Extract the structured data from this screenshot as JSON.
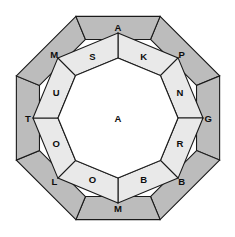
{
  "diagram": {
    "type": "concentric-octagon-ring-puzzle",
    "geometry": {
      "center_x": 118,
      "center_y": 118,
      "outer_radius": 110,
      "middle_radius": 85,
      "inner_radius": 60,
      "sides": 8,
      "outer_ring_rotation_deg": 22.5,
      "inner_ring_rotation_deg": 0
    },
    "colors": {
      "background": "#ffffff",
      "outer_ring_fill": "#bcbcbc",
      "inner_ring_fill": "#e9e9e9",
      "center_fill": "#ffffff",
      "stroke": "#1a1a1a",
      "label_color": "#0d0d0d"
    },
    "outer_ring": {
      "name": "outer-ring",
      "cell_count": 8,
      "cells": [
        {
          "label": "P",
          "index": 0,
          "position": "top-left"
        },
        {
          "label": "G",
          "index": 1,
          "position": "top-right"
        },
        {
          "label": "B",
          "index": 2,
          "position": "right-upper"
        },
        {
          "label": "M",
          "index": 3,
          "position": "right-lower"
        },
        {
          "label": "L",
          "index": 4,
          "position": "bottom-right"
        },
        {
          "label": "T",
          "index": 5,
          "position": "bottom-left"
        },
        {
          "label": "M",
          "index": 6,
          "position": "left-lower"
        },
        {
          "label": "A",
          "index": 7,
          "position": "left-upper"
        }
      ]
    },
    "inner_ring": {
      "name": "inner-ring",
      "cell_count": 8,
      "cells": [
        {
          "label": "K",
          "index": 0,
          "position": "top-left"
        },
        {
          "label": "N",
          "index": 1,
          "position": "top-right"
        },
        {
          "label": "R",
          "index": 2,
          "position": "right-upper"
        },
        {
          "label": "B",
          "index": 3,
          "position": "right-lower"
        },
        {
          "label": "O",
          "index": 4,
          "position": "bottom-right"
        },
        {
          "label": "O",
          "index": 5,
          "position": "bottom-left"
        },
        {
          "label": "U",
          "index": 6,
          "position": "left-lower"
        },
        {
          "label": "S",
          "index": 7,
          "position": "left-upper"
        }
      ]
    },
    "center": {
      "name": "center-cell",
      "label": "A"
    }
  }
}
